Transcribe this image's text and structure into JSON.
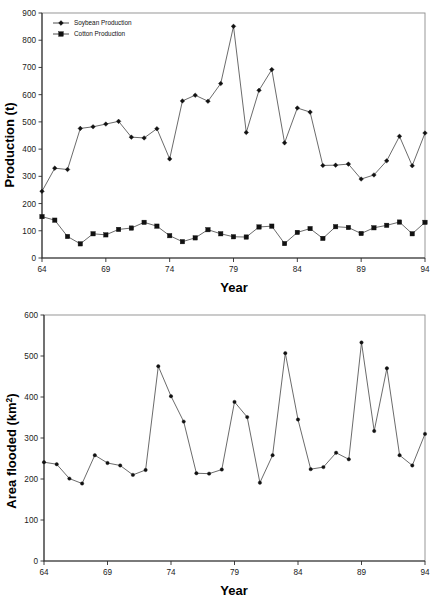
{
  "chart_data": [
    {
      "id": "production",
      "type": "line",
      "title": "",
      "xlabel": "Year",
      "ylabel": "Production (t)",
      "xlim": [
        64,
        94
      ],
      "ylim": [
        0,
        900
      ],
      "xticks": [
        64,
        69,
        74,
        79,
        84,
        89,
        94
      ],
      "yticks": [
        0,
        100,
        200,
        300,
        400,
        500,
        600,
        700,
        800,
        900
      ],
      "grid": false,
      "legend_position": "top-left",
      "x": [
        64,
        65,
        66,
        67,
        68,
        69,
        70,
        71,
        72,
        73,
        74,
        75,
        76,
        77,
        78,
        79,
        80,
        81,
        82,
        83,
        84,
        85,
        86,
        87,
        88,
        89,
        90,
        91,
        92,
        93,
        94
      ],
      "series": [
        {
          "name": "Soybean Production",
          "marker": "diamond",
          "values": [
            245,
            330,
            325,
            476,
            482,
            492,
            502,
            444,
            441,
            475,
            364,
            577,
            598,
            576,
            641,
            851,
            461,
            616,
            692,
            423,
            551,
            536,
            340,
            341,
            345,
            290,
            305,
            357,
            447,
            339,
            459
          ]
        },
        {
          "name": "Cotton Production",
          "marker": "square",
          "values": [
            152,
            139,
            79,
            52,
            89,
            85,
            105,
            110,
            131,
            117,
            82,
            60,
            74,
            104,
            89,
            78,
            77,
            114,
            117,
            53,
            94,
            108,
            72,
            115,
            112,
            90,
            111,
            120,
            132,
            89,
            131
          ]
        }
      ]
    },
    {
      "id": "area-flooded",
      "type": "line",
      "title": "",
      "xlabel": "Year",
      "ylabel": "Area flooded (km2)",
      "ylabel_base": "Area flooded (km",
      "ylabel_sup": "2",
      "ylabel_tail": ")",
      "xlim": [
        64,
        94
      ],
      "ylim": [
        0,
        600
      ],
      "xticks": [
        64,
        69,
        74,
        79,
        84,
        89,
        94
      ],
      "yticks": [
        0,
        100,
        200,
        300,
        400,
        500,
        600
      ],
      "grid": false,
      "legend_position": "none",
      "x": [
        64,
        65,
        66,
        67,
        68,
        69,
        70,
        71,
        72,
        73,
        74,
        75,
        76,
        77,
        78,
        79,
        80,
        81,
        82,
        83,
        84,
        85,
        86,
        87,
        88,
        89,
        90,
        91,
        92,
        93,
        94
      ],
      "series": [
        {
          "name": "Area flooded",
          "marker": "dot",
          "values": [
            241,
            236,
            201,
            189,
            258,
            239,
            233,
            210,
            222,
            475,
            402,
            340,
            214,
            213,
            223,
            388,
            351,
            191,
            258,
            507,
            345,
            224,
            229,
            264,
            248,
            533,
            317,
            470,
            258,
            233,
            310
          ]
        }
      ]
    }
  ],
  "top_chart": {
    "ylabel": "Production (t)",
    "xlabel": "Year",
    "legend": {
      "items": [
        {
          "label": "Soybean Production"
        },
        {
          "label": "Cotton Production"
        }
      ]
    },
    "yticks": [
      "900",
      "800",
      "700",
      "600",
      "500",
      "400",
      "300",
      "200",
      "100",
      "0"
    ],
    "xticks": [
      "64",
      "69",
      "74",
      "79",
      "84",
      "89",
      "94"
    ]
  },
  "bottom_chart": {
    "ylabel_base": "Area flooded (km",
    "ylabel_sup": "2",
    "ylabel_tail": ")",
    "xlabel": "Year",
    "yticks": [
      "600",
      "500",
      "400",
      "300",
      "200",
      "100",
      "0"
    ],
    "xticks": [
      "64",
      "69",
      "74",
      "79",
      "84",
      "89",
      "94"
    ]
  }
}
